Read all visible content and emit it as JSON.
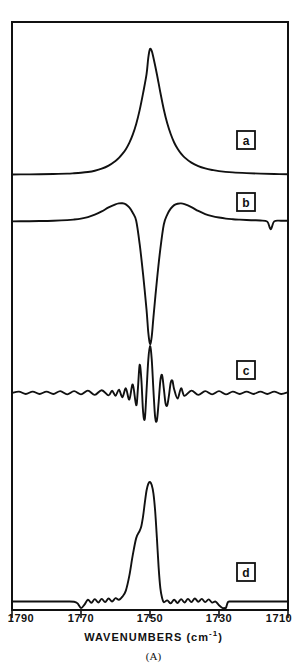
{
  "figure": {
    "caption": "(A)",
    "xlabel_text": "WAVENUMBERS (cm",
    "xlabel_sup": "-1",
    "xlabel_tail": ")",
    "line_color": "#111111",
    "background": "#ffffff"
  },
  "chart_data": {
    "type": "line",
    "title": "",
    "subtitle": "",
    "xlabel": "WAVENUMBERS (cm-1)",
    "ylabel": "",
    "xlim": [
      1790,
      1710
    ],
    "x_reversed": true,
    "xticks": [
      1790,
      1770,
      1750,
      1730,
      1710
    ],
    "xticklabels": [
      "1790",
      "1770",
      "1750",
      "1730",
      "1710"
    ],
    "grid": false,
    "legend": "none",
    "annotations": [
      "a",
      "b",
      "c",
      "d"
    ],
    "panels": [
      {
        "label": "a",
        "description": "Original absorbance band, single broad Lorentzian-like peak",
        "peak_center": 1750,
        "peak_height": 1.0,
        "halfwidth_cm": 11,
        "baseline": 0.0,
        "points": [
          [
            1790,
            0.004
          ],
          [
            1786,
            0.005
          ],
          [
            1782,
            0.006
          ],
          [
            1778,
            0.008
          ],
          [
            1774,
            0.011
          ],
          [
            1772,
            0.014
          ],
          [
            1770,
            0.018
          ],
          [
            1768,
            0.024
          ],
          [
            1766,
            0.034
          ],
          [
            1764,
            0.05
          ],
          [
            1762,
            0.075
          ],
          [
            1760,
            0.112
          ],
          [
            1759,
            0.136
          ],
          [
            1758,
            0.167
          ],
          [
            1757,
            0.205
          ],
          [
            1756,
            0.255
          ],
          [
            1755,
            0.32
          ],
          [
            1754,
            0.405
          ],
          [
            1753,
            0.515
          ],
          [
            1752,
            0.65
          ],
          [
            1751,
            0.8
          ],
          [
            1750.5,
            0.93
          ],
          [
            1750,
            1.0
          ],
          [
            1749.5,
            0.985
          ],
          [
            1749,
            0.93
          ],
          [
            1748,
            0.8
          ],
          [
            1747,
            0.655
          ],
          [
            1746,
            0.52
          ],
          [
            1745,
            0.41
          ],
          [
            1744,
            0.325
          ],
          [
            1743,
            0.258
          ],
          [
            1742,
            0.208
          ],
          [
            1741,
            0.17
          ],
          [
            1740,
            0.14
          ],
          [
            1738,
            0.098
          ],
          [
            1736,
            0.07
          ],
          [
            1734,
            0.052
          ],
          [
            1732,
            0.04
          ],
          [
            1730,
            0.031
          ],
          [
            1726,
            0.021
          ],
          [
            1722,
            0.015
          ],
          [
            1718,
            0.011
          ],
          [
            1714,
            0.008
          ],
          [
            1710,
            0.006
          ]
        ]
      },
      {
        "label": "b",
        "description": "Second derivative: deep negative central lobe at 1750 with two positive side lobes",
        "center": 1750,
        "min_value": -1.0,
        "side_lobe_value": 0.3,
        "points": [
          [
            1790,
            0.01
          ],
          [
            1786,
            0.012
          ],
          [
            1782,
            0.015
          ],
          [
            1778,
            0.02
          ],
          [
            1774,
            0.03
          ],
          [
            1772,
            0.04
          ],
          [
            1770,
            0.055
          ],
          [
            1768,
            0.08
          ],
          [
            1766,
            0.118
          ],
          [
            1764,
            0.17
          ],
          [
            1762,
            0.235
          ],
          [
            1760,
            0.285
          ],
          [
            1759,
            0.3
          ],
          [
            1758,
            0.302
          ],
          [
            1757,
            0.285
          ],
          [
            1756,
            0.235
          ],
          [
            1755,
            0.15
          ],
          [
            1754,
            0.02
          ],
          [
            1753,
            -0.18
          ],
          [
            1752,
            -0.43
          ],
          [
            1751,
            -0.72
          ],
          [
            1750.5,
            -0.905
          ],
          [
            1750,
            -1.0
          ],
          [
            1749.5,
            -0.94
          ],
          [
            1749,
            -0.78
          ],
          [
            1748,
            -0.48
          ],
          [
            1747,
            -0.22
          ],
          [
            1746,
            -0.02
          ],
          [
            1745,
            0.12
          ],
          [
            1744,
            0.215
          ],
          [
            1743,
            0.272
          ],
          [
            1742,
            0.295
          ],
          [
            1741,
            0.3
          ],
          [
            1740,
            0.288
          ],
          [
            1738,
            0.24
          ],
          [
            1736,
            0.178
          ],
          [
            1734,
            0.128
          ],
          [
            1732,
            0.095
          ],
          [
            1730,
            0.072
          ],
          [
            1728,
            0.055
          ],
          [
            1726,
            0.045
          ],
          [
            1724,
            0.038
          ],
          [
            1722,
            0.032
          ],
          [
            1720,
            0.028
          ],
          [
            1718,
            0.024
          ],
          [
            1716,
            0.006
          ],
          [
            1715,
            -0.06
          ],
          [
            1714,
            0.01
          ],
          [
            1712,
            0.02
          ],
          [
            1710,
            0.02
          ]
        ]
      },
      {
        "label": "c",
        "description": "Fourier self-deconvolution with over-deconvolution: sharp central peak with oscillatory side lobes and baseline ripple",
        "center": 1750,
        "peak_height": 1.0,
        "points": [
          [
            1790,
            0.0
          ],
          [
            1788,
            0.03
          ],
          [
            1786,
            -0.02
          ],
          [
            1784,
            0.03
          ],
          [
            1782,
            -0.02
          ],
          [
            1780,
            0.03
          ],
          [
            1778,
            -0.02
          ],
          [
            1776,
            0.04
          ],
          [
            1774,
            -0.03
          ],
          [
            1772,
            0.04
          ],
          [
            1770,
            -0.03
          ],
          [
            1768,
            0.05
          ],
          [
            1766,
            -0.04
          ],
          [
            1764,
            0.06
          ],
          [
            1762,
            -0.05
          ],
          [
            1761,
            0.05
          ],
          [
            1760,
            -0.06
          ],
          [
            1759,
            0.07
          ],
          [
            1758,
            -0.09
          ],
          [
            1757,
            0.1
          ],
          [
            1756,
            -0.14
          ],
          [
            1755,
            0.18
          ],
          [
            1754,
            -0.26
          ],
          [
            1753.5,
            0.1
          ],
          [
            1753,
            0.6
          ],
          [
            1752.5,
            0.28
          ],
          [
            1752,
            -0.4
          ],
          [
            1751.5,
            -0.55
          ],
          [
            1751,
            0.05
          ],
          [
            1750.5,
            0.7
          ],
          [
            1750,
            1.0
          ],
          [
            1749.5,
            0.72
          ],
          [
            1749,
            0.05
          ],
          [
            1748.5,
            -0.52
          ],
          [
            1748,
            -0.58
          ],
          [
            1747.5,
            -0.2
          ],
          [
            1747,
            0.26
          ],
          [
            1746.5,
            0.38
          ],
          [
            1746,
            0.1
          ],
          [
            1745.5,
            -0.22
          ],
          [
            1745,
            -0.26
          ],
          [
            1744.5,
            -0.05
          ],
          [
            1744,
            0.22
          ],
          [
            1743.5,
            0.26
          ],
          [
            1743,
            0.08
          ],
          [
            1742,
            -0.12
          ],
          [
            1741,
            0.1
          ],
          [
            1740,
            -0.06
          ],
          [
            1738,
            0.05
          ],
          [
            1736,
            -0.04
          ],
          [
            1734,
            0.04
          ],
          [
            1732,
            -0.03
          ],
          [
            1730,
            0.04
          ],
          [
            1728,
            -0.03
          ],
          [
            1726,
            0.03
          ],
          [
            1724,
            -0.02
          ],
          [
            1722,
            0.03
          ],
          [
            1720,
            -0.02
          ],
          [
            1718,
            0.03
          ],
          [
            1716,
            -0.02
          ],
          [
            1714,
            0.03
          ],
          [
            1712,
            -0.02
          ],
          [
            1710,
            0.02
          ]
        ]
      },
      {
        "label": "d",
        "description": "Deconvolved band with resolved shoulder on high-wavenumber side and negative side lobe near 1728",
        "main_peak": 1750,
        "shoulder": 1753,
        "peak_height": 1.0,
        "points": [
          [
            1790,
            0.02
          ],
          [
            1786,
            0.02
          ],
          [
            1782,
            0.02
          ],
          [
            1778,
            0.02
          ],
          [
            1774,
            0.02
          ],
          [
            1772,
            0.018
          ],
          [
            1771,
            0.005
          ],
          [
            1770,
            -0.035
          ],
          [
            1769,
            -0.005
          ],
          [
            1768,
            0.035
          ],
          [
            1767,
            0.01
          ],
          [
            1766,
            0.04
          ],
          [
            1765,
            0.012
          ],
          [
            1764,
            0.042
          ],
          [
            1763,
            0.015
          ],
          [
            1762,
            0.045
          ],
          [
            1761,
            0.02
          ],
          [
            1760,
            0.048
          ],
          [
            1759,
            0.035
          ],
          [
            1758,
            0.06
          ],
          [
            1757,
            0.11
          ],
          [
            1756,
            0.23
          ],
          [
            1755,
            0.4
          ],
          [
            1754,
            0.54
          ],
          [
            1753,
            0.6
          ],
          [
            1752.5,
            0.64
          ],
          [
            1752,
            0.72
          ],
          [
            1751.5,
            0.83
          ],
          [
            1751,
            0.93
          ],
          [
            1750.5,
            0.985
          ],
          [
            1750,
            1.0
          ],
          [
            1749.5,
            0.975
          ],
          [
            1749,
            0.905
          ],
          [
            1748.5,
            0.76
          ],
          [
            1748,
            0.54
          ],
          [
            1747.5,
            0.3
          ],
          [
            1747,
            0.13
          ],
          [
            1746.5,
            0.05
          ],
          [
            1746,
            0.015
          ],
          [
            1745,
            0.03
          ],
          [
            1744,
            0.005
          ],
          [
            1743,
            0.035
          ],
          [
            1742,
            0.008
          ],
          [
            1741,
            0.04
          ],
          [
            1740,
            0.012
          ],
          [
            1739,
            0.042
          ],
          [
            1738,
            0.015
          ],
          [
            1737,
            0.045
          ],
          [
            1736,
            0.018
          ],
          [
            1735,
            0.042
          ],
          [
            1734,
            0.015
          ],
          [
            1733,
            0.038
          ],
          [
            1732,
            0.012
          ],
          [
            1731,
            0.02
          ],
          [
            1730,
            -0.01
          ],
          [
            1729,
            -0.055
          ],
          [
            1728.5,
            -0.075
          ],
          [
            1728,
            -0.045
          ],
          [
            1727.5,
            0.01
          ],
          [
            1727,
            0.02
          ],
          [
            1724,
            0.02
          ],
          [
            1720,
            0.02
          ],
          [
            1716,
            0.02
          ],
          [
            1712,
            0.02
          ],
          [
            1710,
            0.02
          ]
        ]
      }
    ]
  }
}
